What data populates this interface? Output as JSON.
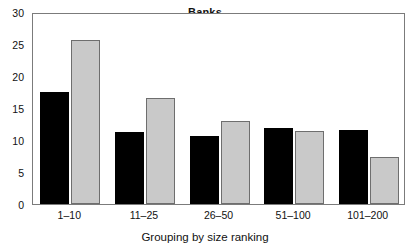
{
  "chart_data": {
    "type": "bar",
    "title": "Banks",
    "xlabel": "Grouping by size ranking",
    "ylabel": "",
    "categories": [
      "1–10",
      "11–25",
      "26–50",
      "51–100",
      "101–200"
    ],
    "series": [
      {
        "name": "dark",
        "color": "#000000",
        "values": [
          17.5,
          11.3,
          10.6,
          11.9,
          11.5
        ]
      },
      {
        "name": "light",
        "color": "#c9c9c9",
        "values": [
          25.7,
          16.5,
          13.0,
          11.4,
          7.3
        ]
      }
    ],
    "ylim": [
      0,
      30
    ],
    "yticks": [
      0,
      5,
      10,
      15,
      20,
      25,
      30
    ],
    "ytick_labels": [
      "0",
      "5",
      "10",
      "15",
      "20",
      "25",
      "30"
    ],
    "grid": false,
    "legend": null
  }
}
